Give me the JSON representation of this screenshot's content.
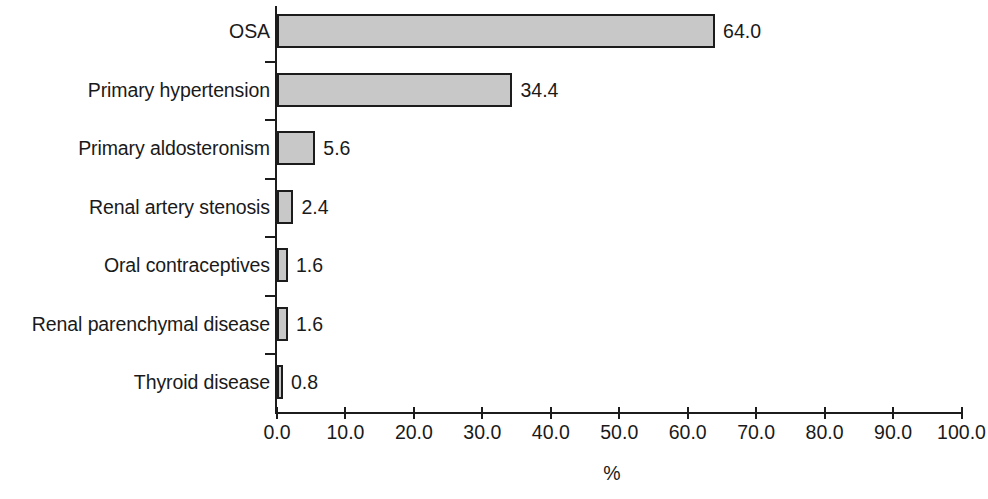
{
  "chart_data": {
    "type": "bar",
    "orientation": "horizontal",
    "title": "",
    "subtitle": "",
    "xlabel": "%",
    "ylabel": "",
    "xlim": [
      0.0,
      100.0
    ],
    "ylim": null,
    "grid": false,
    "legend": null,
    "legend_position": "none",
    "xticks": [
      "0.0",
      "10.0",
      "20.0",
      "30.0",
      "40.0",
      "50.0",
      "60.0",
      "70.0",
      "80.0",
      "90.0",
      "100.0"
    ],
    "xtick_values": [
      0,
      10,
      20,
      30,
      40,
      50,
      60,
      70,
      80,
      90,
      100
    ],
    "categories": [
      "OSA",
      "Primary hypertension",
      "Primary aldosteronism",
      "Renal artery stenosis",
      "Oral contraceptives",
      "Renal parenchymal disease",
      "Thyroid disease"
    ],
    "values": [
      64.0,
      34.4,
      5.6,
      2.4,
      1.6,
      1.6,
      0.8
    ],
    "value_labels": [
      "64.0",
      "34.4",
      "5.6",
      "2.4",
      "1.6",
      "1.6",
      "0.8"
    ],
    "bar_fill_color": "#c8c8c8",
    "bar_edge_color": "#1c1c1c",
    "axis_color": "#1c1c1c",
    "background_color": "#ffffff"
  }
}
